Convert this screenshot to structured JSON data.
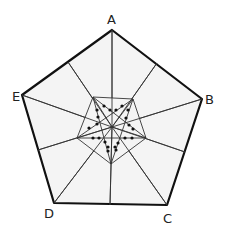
{
  "diagram": {
    "title": "",
    "vertex_labels": {
      "A": "A",
      "B": "B",
      "C": "C",
      "D": "D",
      "E": "E"
    },
    "outer_pentagon": {
      "A": [
        112,
        30
      ],
      "B": [
        202,
        99
      ],
      "C": [
        167,
        205
      ],
      "D": [
        54,
        203
      ],
      "E": [
        22,
        95
      ]
    },
    "edge_midpoints": {
      "AB": [
        157,
        63
      ],
      "BC": [
        185,
        152
      ],
      "CD": [
        110,
        205
      ],
      "DE": [
        38,
        150
      ],
      "EA": [
        68,
        62
      ]
    },
    "center": [
      112,
      127
    ],
    "inner_pentagon": [
      [
        93,
        97
      ],
      [
        133,
        99
      ],
      [
        146,
        138
      ],
      [
        111,
        164
      ],
      [
        77,
        138
      ]
    ],
    "dots": [
      [
        104,
        106
      ],
      [
        97,
        110
      ],
      [
        110,
        110
      ],
      [
        116,
        110
      ],
      [
        122,
        106
      ],
      [
        128,
        110
      ],
      [
        98,
        117
      ],
      [
        126,
        118
      ],
      [
        97,
        124
      ],
      [
        129,
        125
      ],
      [
        89,
        128
      ],
      [
        133,
        129
      ],
      [
        93,
        138
      ],
      [
        99,
        138
      ],
      [
        105,
        142
      ],
      [
        118,
        143
      ],
      [
        125,
        138
      ],
      [
        132,
        138
      ],
      [
        108,
        147
      ],
      [
        115,
        147
      ],
      [
        108,
        151
      ],
      [
        116,
        150
      ]
    ],
    "colors": {
      "fill": "#f4f4f4",
      "stroke": "#111111",
      "dot": "#111111"
    }
  }
}
